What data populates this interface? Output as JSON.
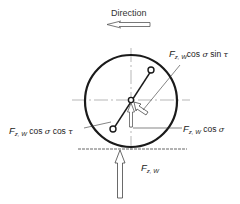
{
  "diagram": {
    "direction_label": "Direction",
    "labels": {
      "top_right": {
        "F": "F",
        "sub": "z, W",
        "expr": "cos",
        "g1": "σ",
        "expr2": "sin",
        "g2": "τ"
      },
      "left": {
        "F": "F",
        "sub": "z, W",
        "expr": "cos",
        "g1": "σ",
        "expr2": "cos",
        "g2": "τ"
      },
      "right": {
        "F": "F",
        "sub": "z, W",
        "expr": "cos",
        "g1": "σ"
      },
      "bottom": {
        "F": "F",
        "sub": "z, W"
      }
    },
    "colors": {
      "stroke": "#1a1a1a",
      "centerline": "#888888",
      "text": "#222222"
    }
  }
}
